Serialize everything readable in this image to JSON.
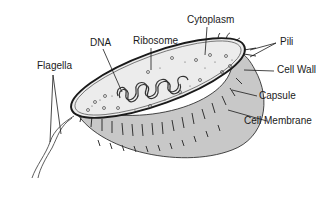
{
  "diagram": {
    "labels": {
      "dna": "DNA",
      "ribosome": "Ribosome",
      "cytoplasm": "Cytoplasm",
      "pili": "Pili",
      "flagella": "Flagella",
      "cell_wall": "Cell Wall",
      "capsule": "Capsule",
      "cell_membrane": "Cell Membrane"
    },
    "colors": {
      "outline": "#1a1a1a",
      "cytoplasm_fill": "#ececec",
      "capsule_fill": "#c8c8c8",
      "background": "#ffffff"
    }
  }
}
